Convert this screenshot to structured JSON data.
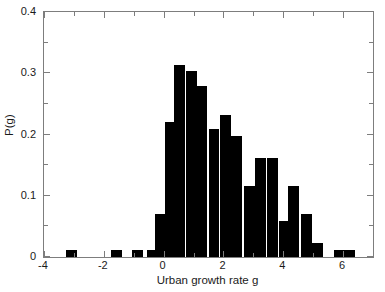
{
  "chart_data": {
    "type": "bar",
    "title": "",
    "subtitle": "",
    "xlabel": "Urban growth rate g",
    "ylabel": "P(g)",
    "xlim": [
      -4,
      7
    ],
    "ylim": [
      0,
      0.4
    ],
    "grid": false,
    "legend": null,
    "bar_color": "#000000",
    "axis_color": "#7d7d7d",
    "bin_width": 0.5,
    "xticks": [
      -4,
      -2,
      0,
      2,
      4,
      6
    ],
    "xticklabels": [
      "-4",
      "-2",
      "0",
      "2",
      "4",
      "6"
    ],
    "xminorticks": [
      -3,
      -1,
      1,
      3,
      5,
      7
    ],
    "yticks": [
      0,
      0.1,
      0.2,
      0.3,
      0.4
    ],
    "yticklabels": [
      "0",
      "0.1",
      "0.2",
      "0.3",
      "0.4"
    ],
    "yminorticks": [
      0.05,
      0.15,
      0.25,
      0.35
    ],
    "bins": [
      {
        "x_left": -3.25,
        "x_center": -3.0,
        "value": 0.011
      },
      {
        "x_left": -1.75,
        "x_center": -1.5,
        "value": 0.011
      },
      {
        "x_left": -1.05,
        "x_center": -0.8,
        "value": 0.011
      },
      {
        "x_left": -0.55,
        "x_center": -0.3,
        "value": 0.011
      },
      {
        "x_left": -0.3,
        "x_center": -0.05,
        "value": 0.07
      },
      {
        "x_left": 0.05,
        "x_center": 0.3,
        "value": 0.22
      },
      {
        "x_left": 0.35,
        "x_center": 0.6,
        "value": 0.313
      },
      {
        "x_left": 0.75,
        "x_center": 1.0,
        "value": 0.303
      },
      {
        "x_left": 1.1,
        "x_center": 1.35,
        "value": 0.279
      },
      {
        "x_left": 1.5,
        "x_center": 1.75,
        "value": 0.209
      },
      {
        "x_left": 1.9,
        "x_center": 2.15,
        "value": 0.232
      },
      {
        "x_left": 2.25,
        "x_center": 2.5,
        "value": 0.197
      },
      {
        "x_left": 2.7,
        "x_center": 2.95,
        "value": 0.116
      },
      {
        "x_left": 3.05,
        "x_center": 3.3,
        "value": 0.162
      },
      {
        "x_left": 3.45,
        "x_center": 3.7,
        "value": 0.162
      },
      {
        "x_left": 3.85,
        "x_center": 4.1,
        "value": 0.058
      },
      {
        "x_left": 4.15,
        "x_center": 4.4,
        "value": 0.116
      },
      {
        "x_left": 4.6,
        "x_center": 4.85,
        "value": 0.07
      },
      {
        "x_left": 4.95,
        "x_center": 5.2,
        "value": 0.023
      },
      {
        "x_left": 5.7,
        "x_center": 5.95,
        "value": 0.011
      },
      {
        "x_left": 6.05,
        "x_center": 6.3,
        "value": 0.011
      }
    ]
  }
}
